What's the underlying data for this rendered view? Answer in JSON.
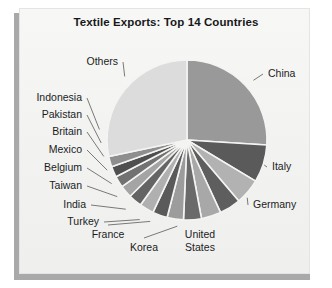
{
  "figure": {
    "title": "Textile Exports: Top 14 Countries",
    "background": "#f4f4f2",
    "frame_color": "#a9a9a9"
  },
  "chart_data": {
    "type": "pie",
    "title": "Textile Exports: Top 14 Countries",
    "xlabel": "",
    "ylabel": "",
    "legend_position": "none",
    "grid": false,
    "start_angle_deg": 0,
    "direction": "clockwise",
    "categories": [
      "China",
      "Italy",
      "Germany",
      "United States",
      "Korea",
      "France",
      "Turkey",
      "India",
      "Taiwan",
      "Belgium",
      "Mexico",
      "Britain",
      "Pakistan",
      "Indonesia",
      "Others"
    ],
    "values": [
      26.0,
      7.6,
      5.2,
      4.3,
      4.0,
      3.6,
      3.3,
      3.0,
      2.9,
      2.7,
      2.5,
      2.3,
      2.2,
      2.1,
      28.3
    ],
    "colors": [
      "#999999",
      "#5a5a5a",
      "#b2b2b2",
      "#5e5e5e",
      "#a8a8a8",
      "#6a6a6a",
      "#9c9c9c",
      "#5a5a5a",
      "#b0b0b0",
      "#646464",
      "#a4a4a4",
      "#727272",
      "#4f4f4f",
      "#8e8e8e",
      "#dcdcdc"
    ],
    "slice_separator_color": "#f4f4f2",
    "labels": [
      {
        "name": "China",
        "side": "right",
        "x": 268,
        "y": 74,
        "align": "l"
      },
      {
        "name": "Italy",
        "side": "right",
        "x": 272,
        "y": 167,
        "align": "l"
      },
      {
        "name": "Germany",
        "side": "right",
        "x": 253,
        "y": 205,
        "align": "l"
      },
      {
        "name": "United",
        "side": "bottom",
        "x": 200,
        "y": 235,
        "align": "c"
      },
      {
        "name": "States",
        "side": "bottom",
        "x": 200,
        "y": 248,
        "align": "c"
      },
      {
        "name": "Korea",
        "side": "bottom",
        "x": 144,
        "y": 248,
        "align": "c"
      },
      {
        "name": "France",
        "side": "bottom",
        "x": 108,
        "y": 235,
        "align": "c"
      },
      {
        "name": "Turkey",
        "side": "left",
        "x": 99,
        "y": 222,
        "align": "r"
      },
      {
        "name": "India",
        "side": "left",
        "x": 86,
        "y": 205,
        "align": "r"
      },
      {
        "name": "Taiwan",
        "side": "left",
        "x": 82,
        "y": 186,
        "align": "r"
      },
      {
        "name": "Belgium",
        "side": "left",
        "x": 82,
        "y": 168,
        "align": "r"
      },
      {
        "name": "Mexico",
        "side": "left",
        "x": 82,
        "y": 150,
        "align": "r"
      },
      {
        "name": "Britain",
        "side": "left",
        "x": 82,
        "y": 132,
        "align": "r"
      },
      {
        "name": "Pakistan",
        "side": "left",
        "x": 82,
        "y": 115,
        "align": "r"
      },
      {
        "name": "Indonesia",
        "side": "left",
        "x": 82,
        "y": 98,
        "align": "r"
      },
      {
        "name": "Others",
        "side": "top",
        "x": 118,
        "y": 62,
        "align": "r"
      }
    ],
    "geometry": {
      "cx": 187,
      "cy": 140,
      "r": 80
    }
  }
}
